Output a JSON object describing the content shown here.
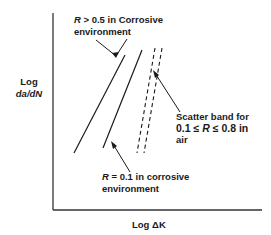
{
  "axes": {
    "y_label_line1": "Log",
    "y_label_line2": "da/dN",
    "x_label_prefix": "Log ΔK",
    "x_label": "Log ΔK"
  },
  "annotations": {
    "r_high_corrosive": {
      "line1_var": "R",
      "line1_rest": " > 0.5 in Corrosive",
      "line2": "environment"
    },
    "r_low_corrosive": {
      "line1_var": "R",
      "line1_rest": " = 0.1 in corrosive",
      "line2": "environment"
    },
    "scatter_band": {
      "line1": "Scatter band for",
      "line2_pre": "0.1 ≤ ",
      "line2_var": "R",
      "line2_post": " ≤ 0.8 in",
      "line3": "air"
    }
  },
  "colors": {
    "line": "#1a1a1a",
    "axis": "#333333",
    "background": "#ffffff"
  }
}
